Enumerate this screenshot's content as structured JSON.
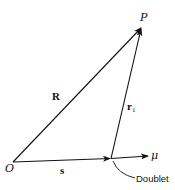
{
  "diagram": {
    "points": {
      "origin": {
        "label": "O"
      },
      "field_point": {
        "label": "P"
      }
    },
    "vectors": {
      "R": {
        "label": "R"
      },
      "r1": {
        "label": "r",
        "subscript": "1"
      },
      "s": {
        "label": "s"
      },
      "mu": {
        "label": "μ"
      }
    },
    "annotations": {
      "doublet": {
        "label": "Doublet"
      }
    },
    "colors": {
      "stroke": "#111111",
      "background": "#ffffff"
    }
  }
}
